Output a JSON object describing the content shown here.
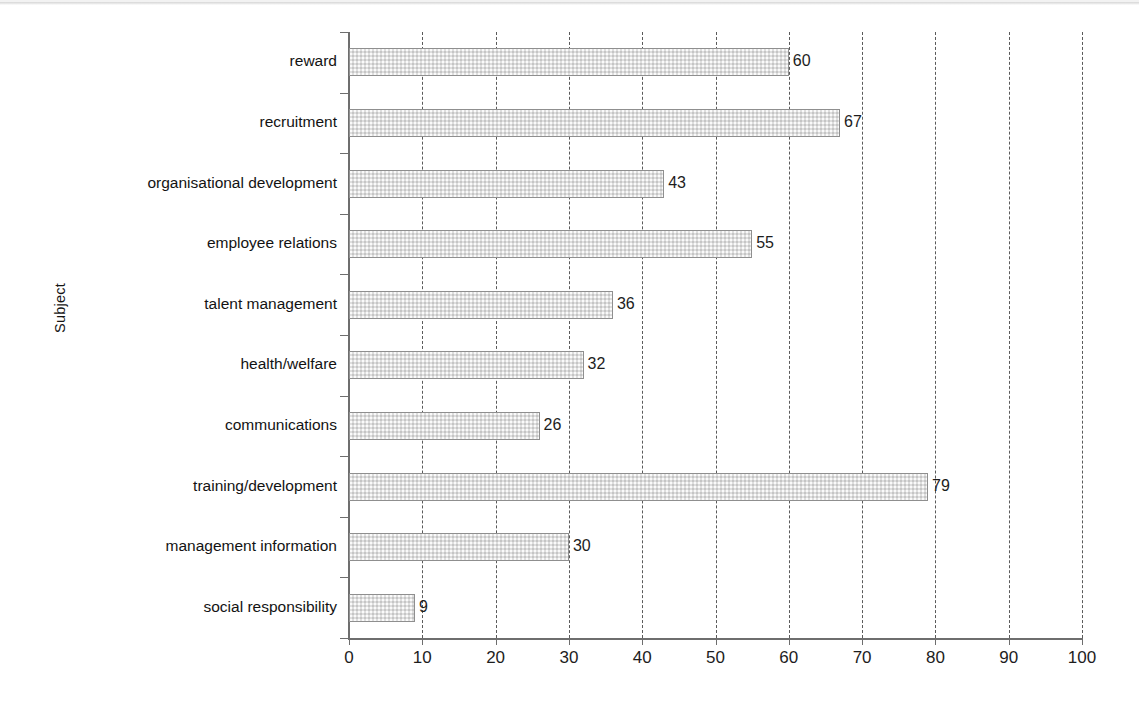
{
  "chart_data": {
    "type": "bar",
    "orientation": "horizontal",
    "title": "",
    "xlabel": "",
    "ylabel": "Subject",
    "categories": [
      "reward",
      "recruitment",
      "organisational development",
      "employee relations",
      "talent management",
      "health/welfare",
      "communications",
      "training/development",
      "management information",
      "social responsibility"
    ],
    "values": [
      60,
      67,
      43,
      55,
      36,
      32,
      26,
      79,
      30,
      9
    ],
    "xlim": [
      0,
      100
    ],
    "xticks": [
      0,
      10,
      20,
      30,
      40,
      50,
      60,
      70,
      80,
      90,
      100
    ],
    "xtick_labels": [
      "0",
      "10",
      "20",
      "30",
      "40",
      "50",
      "60",
      "70",
      "80",
      "90",
      "100"
    ],
    "grid": "vertical-dashed",
    "legend": "none",
    "data_labels": [
      "60",
      "67",
      "43",
      "55",
      "36",
      "32",
      "26",
      "79",
      "30",
      "9"
    ],
    "bar_fill_color": "#dedede",
    "bar_edge_color": "#8f8f8f",
    "axis_color": "#6e6e6e",
    "grid_color": "#5a5a5a",
    "text_color": "#1d1d1d",
    "background_color": "#ffffff"
  }
}
